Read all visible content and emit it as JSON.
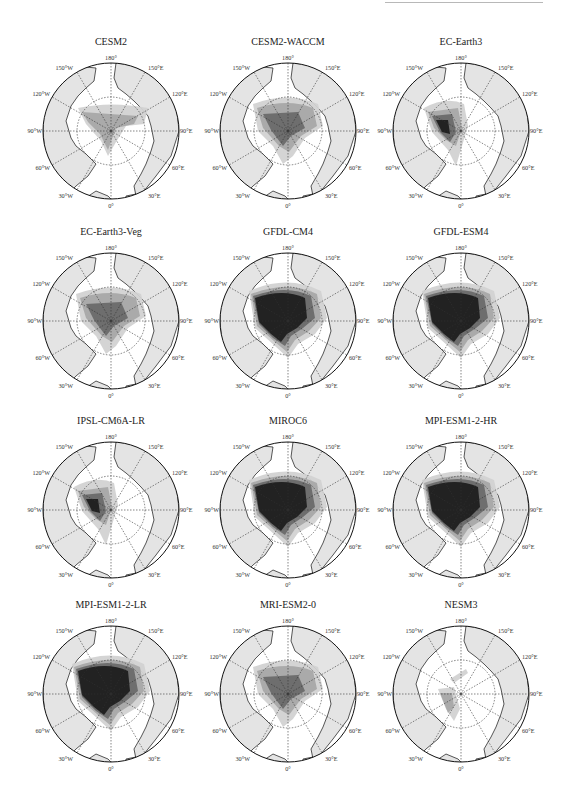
{
  "figure": {
    "layout": {
      "rows": 4,
      "cols": 3
    },
    "colors": {
      "land": "#e4e4e4",
      "ocean": "#ffffff",
      "shade_light": "#d2d2d2",
      "shade_mid": "#a8a8a8",
      "shade_dark": "#6a6a6a",
      "shade_darkest": "#1e1e1e",
      "outline": "#111111",
      "topline": "#b8b8b8"
    },
    "longitude_labels": {
      "top": "180°",
      "bottom": "0°",
      "left": "90°W",
      "right": "90°E",
      "upper_left_1": "150°W",
      "upper_left_2": "120°W",
      "upper_right_1": "150°E",
      "upper_right_2": "120°E",
      "lower_left_1": "60°W",
      "lower_left_2": "30°W",
      "lower_right_1": "60°E",
      "lower_right_2": "30°E"
    },
    "panels": [
      {
        "title": "CESM2",
        "intensity": 2,
        "extent": "band"
      },
      {
        "title": "CESM2-WACCM",
        "intensity": 3,
        "extent": "medium"
      },
      {
        "title": "EC-Earth3",
        "intensity": 3,
        "extent": "west"
      },
      {
        "title": "EC-Earth3-Veg",
        "intensity": 2,
        "extent": "medium"
      },
      {
        "title": "GFDL-CM4",
        "intensity": 4,
        "extent": "large"
      },
      {
        "title": "GFDL-ESM4",
        "intensity": 4,
        "extent": "large"
      },
      {
        "title": "IPSL-CM6A-LR",
        "intensity": 3,
        "extent": "west"
      },
      {
        "title": "MIROC6",
        "intensity": 4,
        "extent": "large"
      },
      {
        "title": "MPI-ESM1-2-HR",
        "intensity": 4,
        "extent": "large"
      },
      {
        "title": "MPI-ESM1-2-LR",
        "intensity": 3,
        "extent": "large"
      },
      {
        "title": "MRI-ESM2-0",
        "intensity": 2,
        "extent": "medium"
      },
      {
        "title": "NESM3",
        "intensity": 1,
        "extent": "small"
      }
    ]
  }
}
